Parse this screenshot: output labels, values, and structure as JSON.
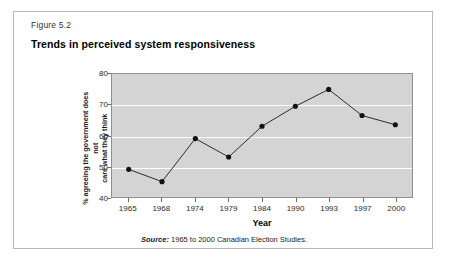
{
  "figure": {
    "number": "Figure 5.2",
    "title": "Trends in perceived system responsiveness",
    "source_label": "Source:",
    "source_text": " 1965 to 2000 Canadian Election Studies."
  },
  "colors": {
    "plot_background": "#d4d4d4",
    "gridline": "#ffffff",
    "series_line": "#2b2b2b",
    "marker": "#111111",
    "frame_border": "#8f8f8f",
    "card_border": "#b9b9b9",
    "page_background": "#ffffff"
  },
  "chart_data": {
    "type": "line",
    "title": "Trends in perceived system responsiveness",
    "xlabel": "Year",
    "ylabel": "% agreeing the government does not care what they think",
    "ylabel_line1": "% agreeing the government does not",
    "ylabel_line2": "care what they think",
    "categories": [
      "1965",
      "1968",
      "1974",
      "1979",
      "1984",
      "1990",
      "1993",
      "1997",
      "2000"
    ],
    "values": [
      49,
      45,
      59,
      53,
      63,
      69.5,
      75,
      66.5,
      63.5
    ],
    "ylim": [
      40,
      80
    ],
    "yticks": [
      80,
      70,
      60,
      50,
      40
    ],
    "ytick_labels": [
      "80",
      "70",
      "60",
      "50",
      "40"
    ],
    "grid": true,
    "grid_axis": "y",
    "legend": "none",
    "marker": "filled-circle",
    "source": "Source: 1965 to 2000 Canadian Election Studies."
  }
}
